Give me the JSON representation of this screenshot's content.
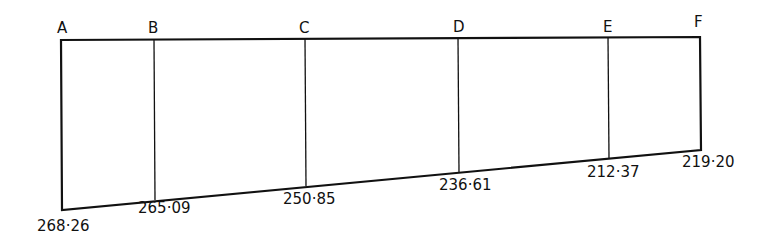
{
  "diagram": {
    "points": [
      {
        "label": "A",
        "value": "268·26"
      },
      {
        "label": "B",
        "value": "265·09"
      },
      {
        "label": "C",
        "value": "250·85"
      },
      {
        "label": "D",
        "value": "236·61"
      },
      {
        "label": "E",
        "value": "212·37"
      },
      {
        "label": "F",
        "value": "219·20"
      }
    ],
    "line_color": "#111111"
  }
}
